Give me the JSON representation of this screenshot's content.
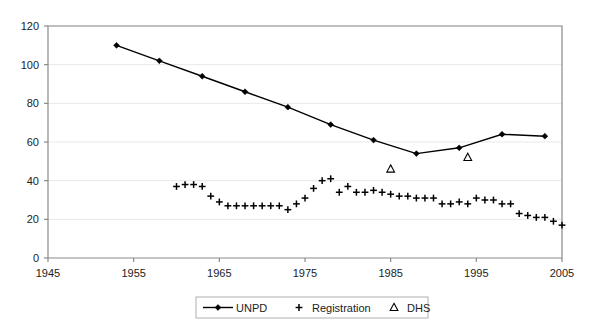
{
  "chart_data": {
    "type": "line",
    "title": "",
    "subtitle": "",
    "xlabel": "",
    "ylabel": "",
    "xlim": [
      1945,
      2005
    ],
    "ylim": [
      0,
      120
    ],
    "xticks": [
      1945,
      1955,
      1965,
      1975,
      1985,
      1995,
      2005
    ],
    "yticks": [
      0,
      20,
      40,
      60,
      80,
      100,
      120
    ],
    "grid": "horizontal",
    "legend_position": "bottom-center",
    "series": [
      {
        "name": "UNPD",
        "marker": "diamond",
        "line": true,
        "color": "#000000",
        "points": [
          {
            "x": 1953,
            "y": 110
          },
          {
            "x": 1958,
            "y": 102
          },
          {
            "x": 1963,
            "y": 94
          },
          {
            "x": 1968,
            "y": 86
          },
          {
            "x": 1973,
            "y": 78
          },
          {
            "x": 1978,
            "y": 69
          },
          {
            "x": 1983,
            "y": 61
          },
          {
            "x": 1988,
            "y": 54
          },
          {
            "x": 1993,
            "y": 57
          },
          {
            "x": 1998,
            "y": 64
          },
          {
            "x": 2003,
            "y": 63
          }
        ]
      },
      {
        "name": "Registration",
        "marker": "plus",
        "line": false,
        "color": "#000000",
        "points": [
          {
            "x": 1960,
            "y": 37
          },
          {
            "x": 1961,
            "y": 38
          },
          {
            "x": 1962,
            "y": 38
          },
          {
            "x": 1963,
            "y": 37
          },
          {
            "x": 1964,
            "y": 32
          },
          {
            "x": 1965,
            "y": 29
          },
          {
            "x": 1966,
            "y": 27
          },
          {
            "x": 1967,
            "y": 27
          },
          {
            "x": 1968,
            "y": 27
          },
          {
            "x": 1969,
            "y": 27
          },
          {
            "x": 1970,
            "y": 27
          },
          {
            "x": 1971,
            "y": 27
          },
          {
            "x": 1972,
            "y": 27
          },
          {
            "x": 1973,
            "y": 25
          },
          {
            "x": 1974,
            "y": 28
          },
          {
            "x": 1975,
            "y": 31
          },
          {
            "x": 1976,
            "y": 36
          },
          {
            "x": 1977,
            "y": 40
          },
          {
            "x": 1978,
            "y": 41
          },
          {
            "x": 1979,
            "y": 34
          },
          {
            "x": 1980,
            "y": 37
          },
          {
            "x": 1981,
            "y": 34
          },
          {
            "x": 1982,
            "y": 34
          },
          {
            "x": 1983,
            "y": 35
          },
          {
            "x": 1984,
            "y": 34
          },
          {
            "x": 1985,
            "y": 33
          },
          {
            "x": 1986,
            "y": 32
          },
          {
            "x": 1987,
            "y": 32
          },
          {
            "x": 1988,
            "y": 31
          },
          {
            "x": 1989,
            "y": 31
          },
          {
            "x": 1990,
            "y": 31
          },
          {
            "x": 1991,
            "y": 28
          },
          {
            "x": 1992,
            "y": 28
          },
          {
            "x": 1993,
            "y": 29
          },
          {
            "x": 1994,
            "y": 28
          },
          {
            "x": 1995,
            "y": 31
          },
          {
            "x": 1996,
            "y": 30
          },
          {
            "x": 1997,
            "y": 30
          },
          {
            "x": 1998,
            "y": 28
          },
          {
            "x": 1999,
            "y": 28
          },
          {
            "x": 2000,
            "y": 23
          },
          {
            "x": 2001,
            "y": 22
          },
          {
            "x": 2002,
            "y": 21
          },
          {
            "x": 2003,
            "y": 21
          },
          {
            "x": 2004,
            "y": 19
          },
          {
            "x": 2005,
            "y": 17
          }
        ]
      },
      {
        "name": "DHS",
        "marker": "triangle",
        "line": false,
        "color": "#000000",
        "points": [
          {
            "x": 1985,
            "y": 46
          },
          {
            "x": 1994,
            "y": 52
          }
        ]
      }
    ]
  },
  "legend": {
    "items": [
      {
        "label": "UNPD",
        "marker": "line-diamond"
      },
      {
        "label": "Registration",
        "marker": "plus"
      },
      {
        "label": "DHS",
        "marker": "triangle"
      }
    ]
  },
  "axes": {
    "y_tick_labels": [
      "0",
      "20",
      "40",
      "60",
      "80",
      "100",
      "120"
    ],
    "x_tick_labels": [
      "1945",
      "1955",
      "1965",
      "1975",
      "1985",
      "1995",
      "2005"
    ]
  }
}
